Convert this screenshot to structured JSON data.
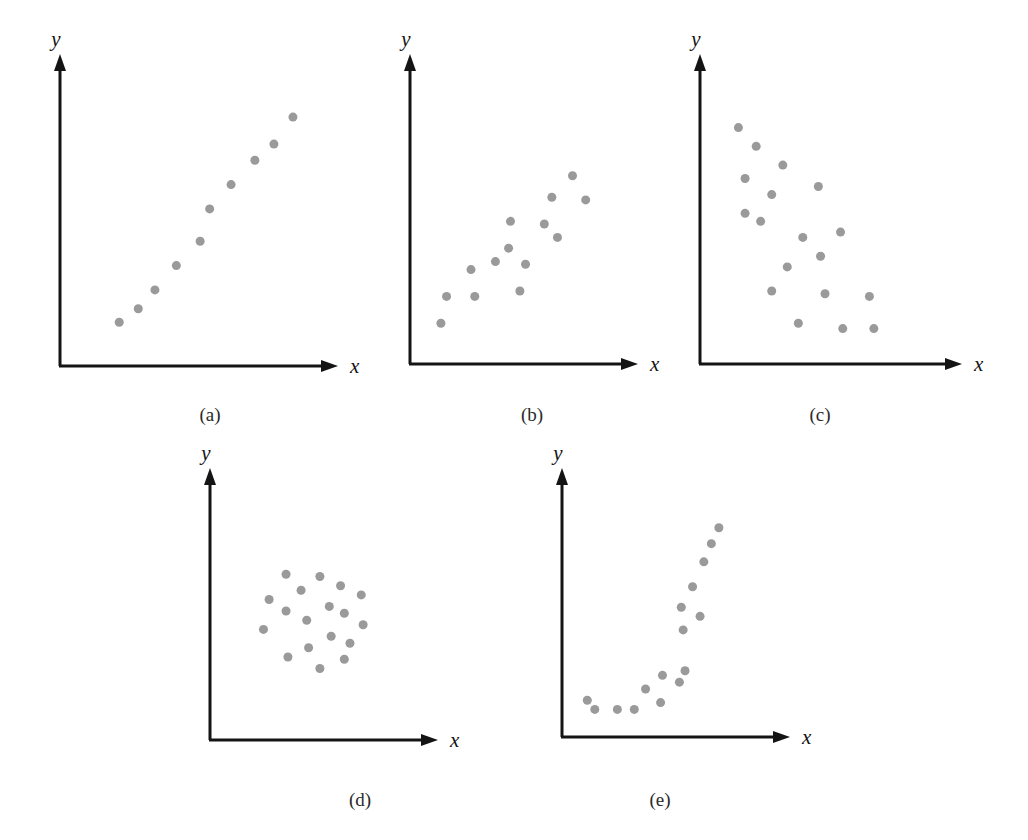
{
  "figure": {
    "title": "",
    "background_color": "#ffffff",
    "dot_color": "#9a9a9a",
    "axis_color": "#141414",
    "dot_radius": 4.5
  },
  "axis_labels": {
    "x": "x",
    "y": "y"
  },
  "captions": {
    "a": "(a)",
    "b": "(b)",
    "c": "(c)",
    "d": "(d)",
    "e": "(e)"
  },
  "chart_data": [
    {
      "id": "a",
      "type": "scatter",
      "title": "(a)",
      "xlabel": "x",
      "ylabel": "y",
      "description": "strong positive linear relationship",
      "grid": false,
      "legend": false,
      "xlim": [
        0,
        100
      ],
      "ylim": [
        0,
        100
      ],
      "points": [
        [
          19,
          11
        ],
        [
          27,
          16
        ],
        [
          34,
          23
        ],
        [
          43,
          32
        ],
        [
          53,
          41
        ],
        [
          57,
          53
        ],
        [
          66,
          62
        ],
        [
          76,
          71
        ],
        [
          84,
          77
        ],
        [
          92,
          87
        ]
      ]
    },
    {
      "id": "b",
      "type": "scatter",
      "title": "(b)",
      "xlabel": "x",
      "ylabel": "y",
      "description": "moderate positive linear relationship",
      "grid": false,
      "legend": false,
      "xlim": [
        0,
        100
      ],
      "ylim": [
        0,
        100
      ],
      "points": [
        [
          9,
          10
        ],
        [
          12,
          20
        ],
        [
          25,
          30
        ],
        [
          27,
          20
        ],
        [
          38,
          33
        ],
        [
          45,
          38
        ],
        [
          46,
          48
        ],
        [
          51,
          22
        ],
        [
          54,
          32
        ],
        [
          64,
          47
        ],
        [
          68,
          57
        ],
        [
          71,
          42
        ],
        [
          79,
          65
        ],
        [
          86,
          56
        ]
      ]
    },
    {
      "id": "c",
      "type": "scatter",
      "title": "(c)",
      "xlabel": "x",
      "ylabel": "y",
      "description": "negative linear relationship",
      "grid": false,
      "legend": false,
      "xlim": [
        0,
        100
      ],
      "ylim": [
        0,
        100
      ],
      "points": [
        [
          11,
          83
        ],
        [
          19,
          76
        ],
        [
          14,
          64
        ],
        [
          31,
          69
        ],
        [
          26,
          58
        ],
        [
          14,
          51
        ],
        [
          47,
          61
        ],
        [
          21,
          48
        ],
        [
          40,
          42
        ],
        [
          33,
          31
        ],
        [
          26,
          22
        ],
        [
          48,
          35
        ],
        [
          57,
          44
        ],
        [
          50,
          21
        ],
        [
          38,
          10
        ],
        [
          58,
          8
        ],
        [
          70,
          20
        ],
        [
          72,
          8
        ]
      ]
    },
    {
      "id": "d",
      "type": "scatter",
      "title": "(d)",
      "xlabel": "x",
      "ylabel": "y",
      "description": "no relationship, random cloud",
      "grid": false,
      "legend": false,
      "xlim": [
        0,
        100
      ],
      "ylim": [
        0,
        100
      ],
      "points": [
        [
          33,
          66
        ],
        [
          51,
          65
        ],
        [
          41,
          59
        ],
        [
          62,
          61
        ],
        [
          24,
          55
        ],
        [
          73,
          57
        ],
        [
          33,
          50
        ],
        [
          56,
          52
        ],
        [
          64,
          49
        ],
        [
          44,
          46
        ],
        [
          21,
          42
        ],
        [
          74,
          44
        ],
        [
          57,
          39
        ],
        [
          67,
          36
        ],
        [
          45,
          34
        ],
        [
          34,
          30
        ],
        [
          64,
          29
        ],
        [
          51,
          25
        ]
      ]
    },
    {
      "id": "e",
      "type": "scatter",
      "title": "(e)",
      "xlabel": "x",
      "ylabel": "y",
      "description": "nonlinear (curvilinear) relationship",
      "grid": false,
      "legend": false,
      "xlim": [
        0,
        100
      ],
      "ylim": [
        0,
        100
      ],
      "points": [
        [
          6,
          10
        ],
        [
          10,
          6
        ],
        [
          22,
          6
        ],
        [
          31,
          6
        ],
        [
          37,
          15
        ],
        [
          46,
          21
        ],
        [
          45,
          9
        ],
        [
          55,
          18
        ],
        [
          58,
          23
        ],
        [
          57,
          41
        ],
        [
          56,
          51
        ],
        [
          62,
          60
        ],
        [
          66,
          47
        ],
        [
          68,
          71
        ],
        [
          72,
          79
        ],
        [
          76,
          86
        ]
      ]
    }
  ],
  "panel_geometry": [
    {
      "id": "a",
      "left": 52,
      "top": 36,
      "width": 300,
      "height": 345,
      "origin_x": 8,
      "origin_y": 330,
      "x_axis_end": 282,
      "y_axis_top": 22
    },
    {
      "id": "b",
      "left": 402,
      "top": 36,
      "width": 250,
      "height": 343,
      "origin_x": 8,
      "origin_y": 328,
      "x_axis_end": 232,
      "y_axis_top": 22
    },
    {
      "id": "c",
      "left": 692,
      "top": 36,
      "width": 285,
      "height": 343,
      "origin_x": 8,
      "origin_y": 328,
      "x_axis_end": 266,
      "y_axis_top": 22
    },
    {
      "id": "d",
      "left": 202,
      "top": 450,
      "width": 250,
      "height": 296,
      "origin_x": 8,
      "origin_y": 290,
      "x_axis_end": 232,
      "y_axis_top": 22
    },
    {
      "id": "e",
      "left": 554,
      "top": 450,
      "width": 250,
      "height": 293,
      "origin_x": 8,
      "origin_y": 287,
      "x_axis_end": 232,
      "y_axis_top": 22
    }
  ],
  "caption_positions": [
    {
      "id": "a",
      "left": 170,
      "top": 404
    },
    {
      "id": "b",
      "left": 492,
      "top": 404
    },
    {
      "id": "c",
      "left": 780,
      "top": 404
    },
    {
      "id": "d",
      "left": 320,
      "top": 789
    },
    {
      "id": "e",
      "left": 620,
      "top": 789
    }
  ]
}
